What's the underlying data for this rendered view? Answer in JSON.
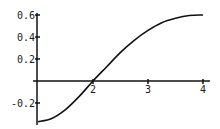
{
  "chart_data": {
    "type": "line",
    "title": "",
    "xlabel": "",
    "ylabel": "",
    "xlim": [
      1,
      4
    ],
    "ylim": [
      -0.37,
      0.6
    ],
    "grid": false,
    "legend": null,
    "x_ticks": [
      {
        "value": 2,
        "label": "2"
      },
      {
        "value": 3,
        "label": "3"
      },
      {
        "value": 4,
        "label": "4"
      }
    ],
    "y_ticks": [
      {
        "value": 0.6,
        "label": "0.6"
      },
      {
        "value": 0.4,
        "label": "0.4"
      },
      {
        "value": 0.2,
        "label": "0.2"
      },
      {
        "value": -0.2,
        "label": "-0.2"
      }
    ],
    "series": [
      {
        "name": "f(x)",
        "color": "#111111",
        "x": [
          1.0,
          1.25,
          1.5,
          1.75,
          2.0,
          2.25,
          2.5,
          2.75,
          3.0,
          3.25,
          3.5,
          3.75,
          4.0
        ],
        "y": [
          -0.37,
          -0.34,
          -0.26,
          -0.14,
          0.0,
          0.13,
          0.26,
          0.37,
          0.46,
          0.53,
          0.57,
          0.595,
          0.6
        ]
      }
    ]
  },
  "colors": {
    "background": "#ffffff",
    "axis": "#111111",
    "line": "#111111"
  }
}
